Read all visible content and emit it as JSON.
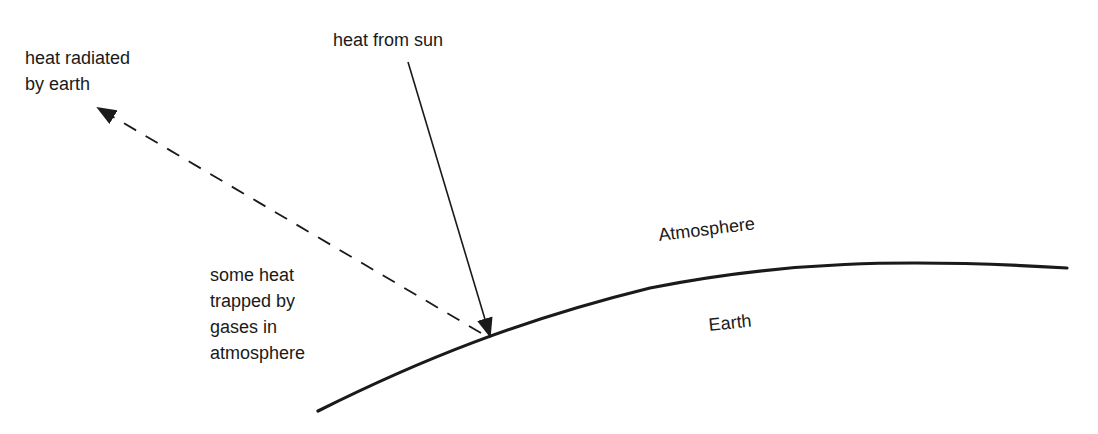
{
  "diagram": {
    "title": "",
    "labels": {
      "heat_radiated": [
        "heat radiated",
        "by earth"
      ],
      "heat_from_sun": "heat from sun",
      "trapped": [
        "some heat",
        "trapped by",
        "gases in",
        "atmosphere"
      ],
      "atmosphere": "Atmosphere",
      "earth": "Earth"
    },
    "elements": {
      "sun_arrow": {
        "style": "solid",
        "from": [
          408,
          62
        ],
        "to": [
          490,
          333
        ],
        "color": "#1a1a1a"
      },
      "radiated_arrow": {
        "style": "dashed",
        "from": [
          481,
          333
        ],
        "to": [
          96,
          107
        ],
        "color": "#1a1a1a"
      },
      "earth_surface_curve": {
        "style": "solid-thick",
        "color": "#1a1a1a"
      }
    }
  }
}
